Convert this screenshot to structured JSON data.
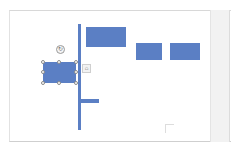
{
  "app": {
    "view": "slide-canvas"
  },
  "colors": {
    "shape_fill": "#5b7fc4",
    "canvas_bg": "#ffffff",
    "panel_bg": "#f2f2f2",
    "handle_border": "#8a8a8a"
  },
  "slide": {
    "shapes": [
      {
        "id": "trunk-line",
        "type": "vertical-bar"
      },
      {
        "id": "top-box",
        "type": "rectangle"
      },
      {
        "id": "mid-box-1",
        "type": "rectangle"
      },
      {
        "id": "mid-box-2",
        "type": "rectangle"
      },
      {
        "id": "selected-box",
        "type": "rectangle",
        "selected": true
      },
      {
        "id": "branch-stub",
        "type": "horizontal-bar"
      }
    ]
  },
  "icons": {
    "rotate_glyph": "↻",
    "layout_options_glyph": "⌂"
  }
}
